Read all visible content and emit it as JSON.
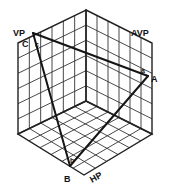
{
  "diagram": {
    "type": "isometric-projection-planes",
    "planes": [
      {
        "id": "vp",
        "label": "VP",
        "name": "vertical plane"
      },
      {
        "id": "avp",
        "label": "AVP",
        "name": "auxiliary vertical plane"
      },
      {
        "id": "hp",
        "label": "HP",
        "name": "horizontal plane"
      }
    ],
    "grid_divisions": 6,
    "points": [
      {
        "label": "A",
        "projection_label": "a"
      },
      {
        "label": "B",
        "projection_label": "b"
      },
      {
        "label": "C",
        "projection_label": "c"
      }
    ],
    "lines": [
      "CA",
      "CB",
      "BA"
    ]
  },
  "labels": {
    "vp": "VP",
    "avp": "AVP",
    "hp": "HP",
    "A": "A",
    "a": "a",
    "B": "B",
    "b": "b",
    "C": "C",
    "c": "c"
  },
  "colors": {
    "line": "#151515",
    "grid": "#333333",
    "background": "#ffffff"
  }
}
